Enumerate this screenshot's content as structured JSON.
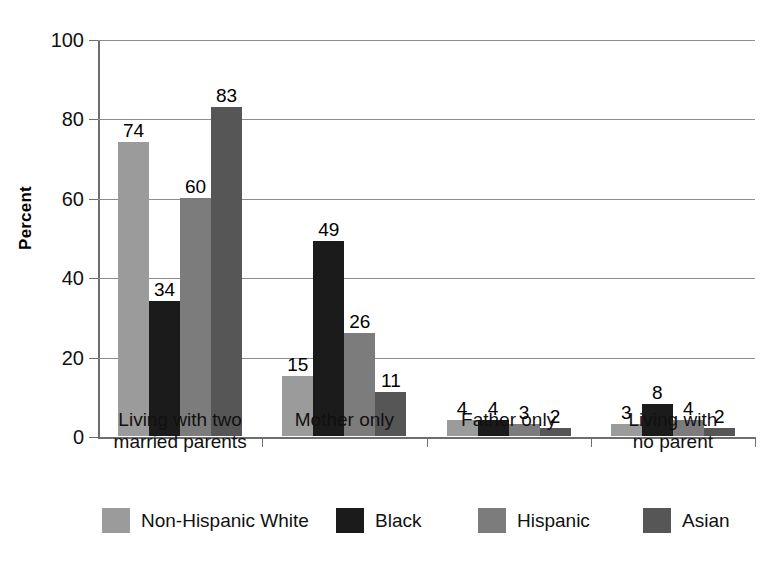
{
  "chart_data": {
    "type": "bar",
    "title": "",
    "subtitle": "",
    "xlabel": "",
    "ylabel": "Percent",
    "ylim": [
      0,
      100
    ],
    "ytick_values": [
      0,
      20,
      40,
      60,
      80,
      100
    ],
    "ytick_labels": [
      "0",
      "20",
      "40",
      "60",
      "80",
      "100"
    ],
    "grid": "horizontal",
    "legend_position": "bottom",
    "orientation": "vertical",
    "grouping": "grouped",
    "categories": [
      "Living with two married parents",
      "Mother only",
      "Father only",
      "Living with no parent"
    ],
    "category_label_lines": [
      [
        "Living with two",
        "married parents"
      ],
      [
        "Mother only"
      ],
      [
        "Father only"
      ],
      [
        "Living with",
        "no parent"
      ]
    ],
    "series": [
      {
        "name": "Non-Hispanic White",
        "color": "#9b9b9b",
        "values": [
          74,
          15,
          4,
          3
        ]
      },
      {
        "name": "Black",
        "color": "#1b1b1b",
        "values": [
          34,
          49,
          4,
          8
        ]
      },
      {
        "name": "Hispanic",
        "color": "#7c7c7c",
        "values": [
          60,
          26,
          3,
          4
        ]
      },
      {
        "name": "Asian",
        "color": "#565656",
        "values": [
          83,
          11,
          2,
          2
        ]
      }
    ],
    "data_labels": [
      [
        "74",
        "34",
        "60",
        "83"
      ],
      [
        "15",
        "49",
        "26",
        "11"
      ],
      [
        "4",
        "4",
        "3",
        "2"
      ],
      [
        "3",
        "8",
        "4",
        "2"
      ]
    ],
    "axis_color": "#6d6d6d",
    "gridline_color": "#8d8d8d",
    "background_color": "#ffffff"
  }
}
